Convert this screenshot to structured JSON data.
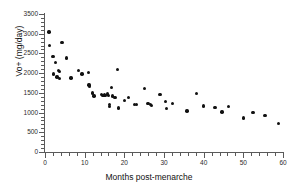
{
  "chart_data": {
    "type": "scatter",
    "title": "",
    "xlabel": "Months post-menarche",
    "ylabel": "Vo+ (mg/day)",
    "xlim": [
      0,
      60
    ],
    "ylim": [
      0,
      3500
    ],
    "xticks": [
      0,
      10,
      20,
      30,
      40,
      50,
      60
    ],
    "yticks": [
      0,
      500,
      1000,
      1500,
      2000,
      2500,
      3000,
      3500
    ],
    "xtick_labels": [
      "0",
      "10",
      "20",
      "30",
      "40",
      "50",
      "60"
    ],
    "ytick_labels": [
      "0",
      "500",
      "1000",
      "1500",
      "2000",
      "2500",
      "3000",
      "3500"
    ],
    "x_minor_tick_step": 2,
    "y_minor_tick_step": 100,
    "grid": false,
    "legend": false,
    "marker": "filled-circle",
    "marker_color": "#111111",
    "axis_color": "#5a5a5a",
    "spines": [
      "left",
      "bottom"
    ],
    "n_points": 66,
    "points": [
      [
        1.0,
        3040
      ],
      [
        1.2,
        2700
      ],
      [
        2.0,
        2420
      ],
      [
        2.1,
        1980
      ],
      [
        2.6,
        2270
      ],
      [
        3.0,
        1900
      ],
      [
        3.4,
        2060
      ],
      [
        3.6,
        2040
      ],
      [
        3.7,
        1870
      ],
      [
        4.3,
        2770
      ],
      [
        5.4,
        2380
      ],
      [
        6.6,
        1880
      ],
      [
        8.4,
        2060
      ],
      [
        9.3,
        1980
      ],
      [
        11.0,
        2010
      ],
      [
        11.1,
        1700
      ],
      [
        11.2,
        1660
      ],
      [
        11.9,
        1500
      ],
      [
        12.4,
        1420
      ],
      [
        14.3,
        1460
      ],
      [
        14.6,
        1440
      ],
      [
        15.0,
        1450
      ],
      [
        15.3,
        1430
      ],
      [
        15.8,
        1470
      ],
      [
        16.0,
        1440
      ],
      [
        16.2,
        1200
      ],
      [
        16.3,
        1160
      ],
      [
        16.8,
        1630
      ],
      [
        17.0,
        1420
      ],
      [
        17.6,
        1380
      ],
      [
        18.2,
        2100
      ],
      [
        18.5,
        1120
      ],
      [
        20.0,
        1300
      ],
      [
        21.0,
        1380
      ],
      [
        22.5,
        1200
      ],
      [
        23.1,
        1210
      ],
      [
        25.1,
        1610
      ],
      [
        26.0,
        1230
      ],
      [
        26.6,
        1200
      ],
      [
        26.8,
        1180
      ],
      [
        29.0,
        1460
      ],
      [
        30.4,
        1280
      ],
      [
        30.6,
        1110
      ],
      [
        32.1,
        1230
      ],
      [
        35.8,
        1040
      ],
      [
        38.2,
        1490
      ],
      [
        40.0,
        1170
      ],
      [
        42.9,
        1130
      ],
      [
        44.6,
        1010
      ],
      [
        46.2,
        1150
      ],
      [
        50.1,
        860
      ],
      [
        52.4,
        1000
      ],
      [
        55.5,
        930
      ],
      [
        58.8,
        720
      ]
    ]
  }
}
